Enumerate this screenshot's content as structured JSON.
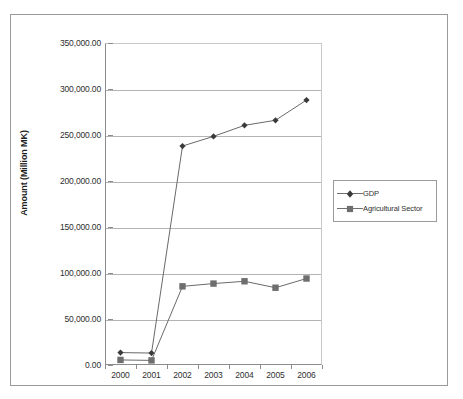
{
  "chart_data": {
    "type": "line",
    "title": "",
    "xlabel": "",
    "ylabel": "Amount (Million MK)",
    "categories": [
      "2000",
      "2001",
      "2002",
      "2003",
      "2004",
      "2005",
      "2006"
    ],
    "ylim": [
      0,
      350000
    ],
    "ytick_labels": [
      "350,000.00",
      "300,000.00",
      "250,000.00",
      "200,000.00",
      "150,000.00",
      "100,000.00",
      "50,000.00",
      "0.00"
    ],
    "ytick_values": [
      350000,
      300000,
      250000,
      200000,
      150000,
      100000,
      50000,
      0
    ],
    "grid": true,
    "legend_position": "right",
    "series": [
      {
        "name": "GDP",
        "marker": "diamond",
        "color": "#3a3a3a",
        "values": [
          13500,
          13000,
          238000,
          248500,
          260500,
          266000,
          288000
        ]
      },
      {
        "name": "Agricultural Sector",
        "marker": "square",
        "color": "#6e6e6e",
        "values": [
          5500,
          5000,
          85500,
          88500,
          91000,
          84000,
          94000
        ]
      }
    ]
  },
  "legend": {
    "items": [
      {
        "label": "GDP"
      },
      {
        "label": "Agricultural Sector"
      }
    ]
  }
}
